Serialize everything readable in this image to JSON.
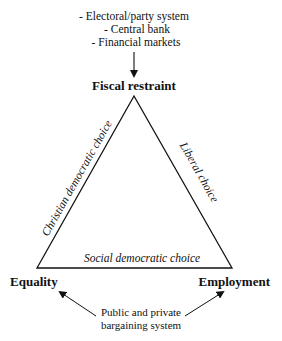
{
  "pressures": [
    "- Electoral/party system",
    "- Central bank",
    "- Financial markets"
  ],
  "vertices": {
    "top": "Fiscal restraint",
    "left": "Equality",
    "right": "Employment"
  },
  "edges": {
    "left": "Christian democratic choice",
    "right": "Liberal choice",
    "bottom": "Social democratic choice"
  },
  "bottom_source": [
    "Public and private",
    "bargaining system"
  ]
}
